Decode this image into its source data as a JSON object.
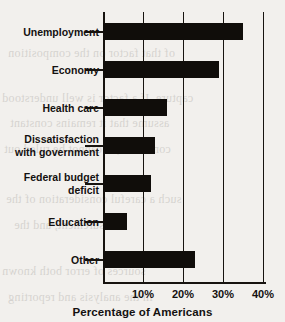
{
  "chart_data": {
    "type": "bar",
    "orientation": "horizontal",
    "title": "",
    "xlabel": "Percentage of Americans",
    "ylabel": "",
    "categories": [
      "Unemployment",
      "Economy",
      "Health care",
      "Dissatisfaction with government",
      "Federal budget deficit",
      "Education",
      "Other"
    ],
    "values": [
      35,
      29,
      16,
      13,
      12,
      6,
      23
    ],
    "xlim": [
      0,
      42
    ],
    "xticks": [
      10,
      20,
      30,
      40
    ],
    "xtick_labels": [
      "10%",
      "20%",
      "30%",
      "40%"
    ],
    "grid": "vertical",
    "legend": "none",
    "bar_color": "#100d0a",
    "background_color": "#f2f0ed"
  },
  "chart": {
    "axis_title": "Percentage of Americans",
    "categories": [
      {
        "label": "Unemployment",
        "lines": [
          "Unemployment"
        ],
        "value": 35
      },
      {
        "label": "Economy",
        "lines": [
          "Economy"
        ],
        "value": 29
      },
      {
        "label": "Health care",
        "lines": [
          "Health care"
        ],
        "value": 16
      },
      {
        "label": "Dissatisfaction with government",
        "lines": [
          "Dissatisfaction",
          "with government"
        ],
        "value": 13
      },
      {
        "label": "Federal budget deficit",
        "lines": [
          "Federal budget",
          "deficit"
        ],
        "value": 12
      },
      {
        "label": "Education",
        "lines": [
          "Education"
        ],
        "value": 6
      },
      {
        "label": "Other",
        "lines": [
          "Other"
        ],
        "value": 23
      }
    ],
    "ticks": [
      {
        "label": "10%",
        "value": 10
      },
      {
        "label": "20%",
        "value": 20
      },
      {
        "label": "30%",
        "value": 30
      },
      {
        "label": "40%",
        "value": 40
      }
    ]
  },
  "page_bleed": {
    "lines": [
      "of that factor on the composition",
      "capture. If a factor is well understood",
      "assume that it remains constant",
      "controlled, it cannot be ruled out",
      "such a careful consideration of the",
      "measurement, and the",
      "sources of error both known",
      "in the analysis and reporting"
    ]
  }
}
